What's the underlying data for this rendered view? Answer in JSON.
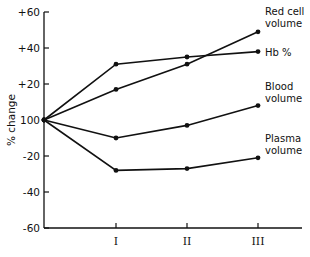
{
  "chart_data": {
    "type": "line",
    "title": "",
    "xlabel": "",
    "ylabel": "% change",
    "categories": [
      "",
      "I",
      "II",
      "III"
    ],
    "ylim": [
      -60,
      60
    ],
    "y_ticks": [
      "+60",
      "+40",
      "+20",
      "100",
      "-20",
      "-40",
      "-60"
    ],
    "y_tick_values": [
      60,
      40,
      20,
      0,
      -20,
      -40,
      -60
    ],
    "grid": false,
    "legend": "inline labels at line ends (right)",
    "series": [
      {
        "name": "Red cell volume",
        "label_lines": [
          "Red cell",
          "volume"
        ],
        "values": [
          0,
          17,
          31,
          49
        ]
      },
      {
        "name": "Hb %",
        "label_lines": [
          "Hb %"
        ],
        "values": [
          0,
          31,
          35,
          38
        ]
      },
      {
        "name": "Blood volume",
        "label_lines": [
          "Blood",
          "volume"
        ],
        "values": [
          0,
          -10,
          -3,
          8
        ]
      },
      {
        "name": "Plasma volume",
        "label_lines": [
          "Plasma",
          "volume"
        ],
        "values": [
          0,
          -28,
          -27,
          -21
        ]
      }
    ]
  }
}
